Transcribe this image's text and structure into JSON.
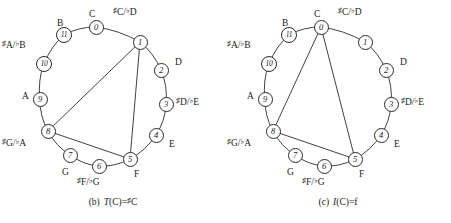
{
  "figures": [
    {
      "id": "fig-b",
      "caption": {
        "tag": "(b)",
        "func": "T",
        "arg": "(C)",
        "eq": "=",
        "accidental": "♯",
        "result": "C"
      },
      "nodes": [
        {
          "id": "0",
          "label": "0"
        },
        {
          "id": "1",
          "label": "1"
        },
        {
          "id": "2",
          "label": "2"
        },
        {
          "id": "3",
          "label": "3"
        },
        {
          "id": "4",
          "label": "4"
        },
        {
          "id": "5",
          "label": "5"
        },
        {
          "id": "6",
          "label": "6"
        },
        {
          "id": "7",
          "label": "7"
        },
        {
          "id": "8",
          "label": "8"
        },
        {
          "id": "9",
          "label": "9"
        },
        {
          "id": "10",
          "label": "10"
        },
        {
          "id": "11",
          "label": "11"
        }
      ],
      "note_labels": [
        {
          "for": "0",
          "sharp": "",
          "text": "C",
          "flat": "",
          "text2": ""
        },
        {
          "for": "1",
          "sharp": "♯",
          "text": "C/",
          "flat": "♭",
          "text2": "D"
        },
        {
          "for": "2",
          "sharp": "",
          "text": "D",
          "flat": "",
          "text2": ""
        },
        {
          "for": "3",
          "sharp": "♯",
          "text": "D/",
          "flat": "♭",
          "text2": "E"
        },
        {
          "for": "4",
          "sharp": "",
          "text": "E",
          "flat": "",
          "text2": ""
        },
        {
          "for": "5",
          "sharp": "",
          "text": "F",
          "flat": "",
          "text2": ""
        },
        {
          "for": "6",
          "sharp": "♯",
          "text": "F/",
          "flat": "♭",
          "text2": "G"
        },
        {
          "for": "7",
          "sharp": "",
          "text": "G",
          "flat": "",
          "text2": ""
        },
        {
          "for": "8",
          "sharp": "♯",
          "text": "G/",
          "flat": "♭",
          "text2": "A"
        },
        {
          "for": "9",
          "sharp": "",
          "text": "A",
          "flat": "",
          "text2": ""
        },
        {
          "for": "10",
          "sharp": "♯",
          "text": "A/",
          "flat": "♭",
          "text2": "B"
        },
        {
          "for": "11",
          "sharp": "",
          "text": "B",
          "flat": "",
          "text2": ""
        }
      ],
      "chord_nodes": [
        "1",
        "5",
        "8"
      ],
      "edges": [
        [
          "1",
          "5"
        ],
        [
          "1",
          "8"
        ],
        [
          "5",
          "8"
        ]
      ]
    },
    {
      "id": "fig-c",
      "caption": {
        "tag": "(c)",
        "func": "I",
        "arg": "(C)",
        "eq": "=",
        "accidental": "",
        "result": "f"
      },
      "nodes": [
        {
          "id": "0",
          "label": "0"
        },
        {
          "id": "1",
          "label": "1"
        },
        {
          "id": "2",
          "label": "2"
        },
        {
          "id": "3",
          "label": "3"
        },
        {
          "id": "4",
          "label": "4"
        },
        {
          "id": "5",
          "label": "5"
        },
        {
          "id": "6",
          "label": "6"
        },
        {
          "id": "7",
          "label": "7"
        },
        {
          "id": "8",
          "label": "8"
        },
        {
          "id": "9",
          "label": "9"
        },
        {
          "id": "10",
          "label": "10"
        },
        {
          "id": "11",
          "label": "11"
        }
      ],
      "note_labels": [
        {
          "for": "0",
          "sharp": "",
          "text": "C",
          "flat": "",
          "text2": ""
        },
        {
          "for": "1",
          "sharp": "♯",
          "text": "C/",
          "flat": "♭",
          "text2": "D"
        },
        {
          "for": "2",
          "sharp": "",
          "text": "D",
          "flat": "",
          "text2": ""
        },
        {
          "for": "3",
          "sharp": "♯",
          "text": "D/",
          "flat": "♭",
          "text2": "E"
        },
        {
          "for": "4",
          "sharp": "",
          "text": "E",
          "flat": "",
          "text2": ""
        },
        {
          "for": "5",
          "sharp": "",
          "text": "F",
          "flat": "",
          "text2": ""
        },
        {
          "for": "6",
          "sharp": "♯",
          "text": "F/",
          "flat": "♭",
          "text2": "G"
        },
        {
          "for": "7",
          "sharp": "",
          "text": "G",
          "flat": "",
          "text2": ""
        },
        {
          "for": "8",
          "sharp": "♯",
          "text": "G/",
          "flat": "♭",
          "text2": "A"
        },
        {
          "for": "9",
          "sharp": "",
          "text": "A",
          "flat": "",
          "text2": ""
        },
        {
          "for": "10",
          "sharp": "♯",
          "text": "A/",
          "flat": "♭",
          "text2": "B"
        },
        {
          "for": "11",
          "sharp": "",
          "text": "B",
          "flat": "",
          "text2": ""
        }
      ],
      "chord_nodes": [
        "0",
        "5",
        "8"
      ],
      "edges": [
        [
          "0",
          "5"
        ],
        [
          "0",
          "8"
        ],
        [
          "5",
          "8"
        ]
      ]
    }
  ],
  "geometry": {
    "colors": {
      "ink": "#2b2b2b",
      "background": "#ffffff"
    },
    "ring": {
      "cx": 103,
      "cy": 97,
      "rx": 62,
      "ry": 72,
      "start_angle_deg": -80,
      "direction": "clockwise"
    },
    "node_positions": {
      "0": [
        96,
        27
      ],
      "1": [
        140,
        42
      ],
      "2": [
        161,
        70
      ],
      "3": [
        166,
        104
      ],
      "4": [
        156,
        135
      ],
      "5": [
        130,
        159
      ],
      "6": [
        99,
        166
      ],
      "7": [
        70,
        155
      ],
      "8": [
        48,
        131
      ],
      "9": [
        40,
        99
      ],
      "10": [
        44,
        64
      ],
      "11": [
        64,
        35
      ]
    },
    "label_positions": {
      "0": [
        89,
        10
      ],
      "1": [
        113,
        8
      ],
      "2": [
        175,
        58
      ],
      "3": [
        176,
        98
      ],
      "4": [
        169,
        140
      ],
      "5": [
        134,
        170
      ],
      "6": [
        77,
        178
      ],
      "7": [
        62,
        168
      ],
      "8": [
        2,
        139
      ],
      "9": [
        22,
        92
      ],
      "10": [
        2,
        41
      ],
      "11": [
        57,
        19
      ]
    }
  }
}
